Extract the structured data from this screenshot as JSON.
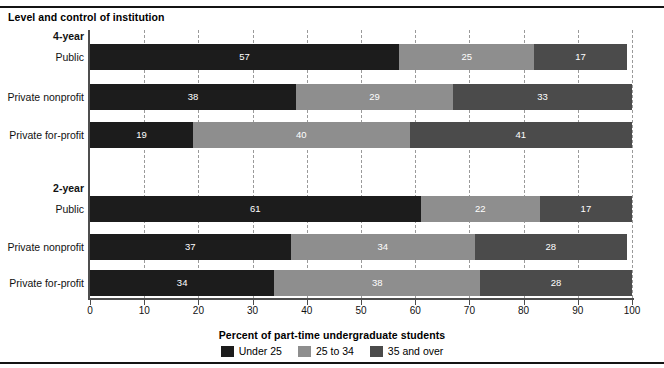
{
  "figure": {
    "group_heading": "Level and control of institution",
    "axis_title": "Percent of part-time undergraduate students"
  },
  "colors": {
    "under25": "#1c1c1c",
    "age25to34": "#8e8e8e",
    "age35over": "#4b4b4b",
    "axis": "#4d4d4d",
    "grid": "#9a9a9a",
    "rule": "#141414",
    "value_text": "#ffffff"
  },
  "legend": {
    "items": [
      {
        "label": "Under 25",
        "color": "#1c1c1c",
        "swatch": "legend-swatch-under-25"
      },
      {
        "label": "25 to 34",
        "color": "#8e8e8e",
        "swatch": "legend-swatch-25-to-34"
      },
      {
        "label": "35 and over",
        "color": "#4b4b4b",
        "swatch": "legend-swatch-35-and-over"
      }
    ]
  },
  "sections": [
    {
      "label": "4-year"
    },
    {
      "label": "2-year"
    }
  ],
  "row_labels": {
    "public": "Public",
    "private_nonprofit": "Private nonprofit",
    "private_forprofit": "Private for-profit"
  },
  "ticks": {
    "labels": [
      "0",
      "10",
      "20",
      "30",
      "40",
      "50",
      "60",
      "70",
      "80",
      "90",
      "100"
    ],
    "values": [
      0,
      10,
      20,
      30,
      40,
      50,
      60,
      70,
      80,
      90,
      100
    ]
  },
  "chart_data": {
    "type": "bar",
    "orientation": "horizontal",
    "stacked": true,
    "stack_total": 100,
    "title": "",
    "subtitle": "",
    "group_heading": "Level and control of institution",
    "xlabel": "Percent of part-time undergraduate students",
    "ylabel": "Level and control of institution",
    "xlim": [
      0,
      100
    ],
    "xticks": [
      0,
      10,
      20,
      30,
      40,
      50,
      60,
      70,
      80,
      90,
      100
    ],
    "grid": "vertical-dashed",
    "legend_position": "bottom-center",
    "categories": [
      "4-year: Public",
      "4-year: Private nonprofit",
      "4-year: Private for-profit",
      "2-year: Public",
      "2-year: Private nonprofit",
      "2-year: Private for-profit"
    ],
    "series": [
      {
        "name": "Under 25",
        "color": "#1c1c1c",
        "values": [
          57,
          38,
          19,
          61,
          37,
          34
        ]
      },
      {
        "name": "25 to 34",
        "color": "#8e8e8e",
        "values": [
          25,
          29,
          40,
          22,
          34,
          38
        ]
      },
      {
        "name": "35 and over",
        "color": "#4b4b4b",
        "values": [
          17,
          33,
          41,
          17,
          28,
          28
        ]
      }
    ],
    "groups": [
      {
        "group": "4-year",
        "rows": [
          {
            "label": "Public",
            "segments": [
              {
                "name": "Under 25",
                "value": 57
              },
              {
                "name": "25 to 34",
                "value": 25
              },
              {
                "name": "35 and over",
                "value": 17
              }
            ]
          },
          {
            "label": "Private nonprofit",
            "segments": [
              {
                "name": "Under 25",
                "value": 38
              },
              {
                "name": "25 to 34",
                "value": 29
              },
              {
                "name": "35 and over",
                "value": 33
              }
            ]
          },
          {
            "label": "Private for-profit",
            "segments": [
              {
                "name": "Under 25",
                "value": 19
              },
              {
                "name": "25 to 34",
                "value": 40
              },
              {
                "name": "35 and over",
                "value": 41
              }
            ]
          }
        ]
      },
      {
        "group": "2-year",
        "rows": [
          {
            "label": "Public",
            "segments": [
              {
                "name": "Under 25",
                "value": 61
              },
              {
                "name": "25 to 34",
                "value": 22
              },
              {
                "name": "35 and over",
                "value": 17
              }
            ]
          },
          {
            "label": "Private nonprofit",
            "segments": [
              {
                "name": "Under 25",
                "value": 37
              },
              {
                "name": "25 to 34",
                "value": 34
              },
              {
                "name": "35 and over",
                "value": 28
              }
            ]
          },
          {
            "label": "Private for-profit",
            "segments": [
              {
                "name": "Under 25",
                "value": 34
              },
              {
                "name": "25 to 34",
                "value": 38
              },
              {
                "name": "35 and over",
                "value": 28
              }
            ]
          }
        ]
      }
    ]
  },
  "layout": {
    "plot_left_px": 90,
    "plot_right_px": 632,
    "plot_top_px": 30,
    "baseline_px": 298,
    "bar_height_px": 26,
    "row_tops_px": [
      44,
      84,
      122,
      196,
      234,
      270
    ],
    "section_label_tops_px": [
      30,
      182
    ]
  }
}
